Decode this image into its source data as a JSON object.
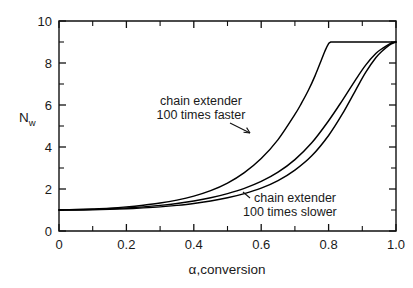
{
  "chart_data": {
    "type": "line",
    "title": "",
    "xlabel": "α,conversion",
    "ylabel": "Nw",
    "ylabel_base": "N",
    "ylabel_sub": "w",
    "xlim": [
      0,
      1.0
    ],
    "ylim": [
      0,
      10
    ],
    "grid": false,
    "legend": "none",
    "x_ticks": [
      "0",
      "0.2",
      "0.4",
      "0.6",
      "0.8",
      "1.0"
    ],
    "x_tick_values": [
      0,
      0.2,
      0.4,
      0.6,
      0.8,
      1.0
    ],
    "x_minor_tick_values": [
      0.1,
      0.3,
      0.5,
      0.7,
      0.9
    ],
    "y_ticks": [
      "0",
      "2",
      "4",
      "6",
      "8",
      "10"
    ],
    "y_tick_values": [
      0,
      2,
      4,
      6,
      8,
      10
    ],
    "y_minor_tick_values": [
      1,
      3,
      5,
      7,
      9
    ],
    "series": [
      {
        "name": "chain extender 100 times faster",
        "x": [
          0.0,
          0.05,
          0.1,
          0.15,
          0.2,
          0.25,
          0.3,
          0.35,
          0.4,
          0.45,
          0.5,
          0.55,
          0.6,
          0.65,
          0.7,
          0.72,
          0.74,
          0.76,
          0.78,
          0.79,
          0.8,
          0.805,
          0.81,
          0.85,
          0.9,
          0.95,
          1.0
        ],
        "y": [
          1.0,
          1.02,
          1.05,
          1.09,
          1.15,
          1.23,
          1.33,
          1.47,
          1.66,
          1.92,
          2.28,
          2.78,
          3.45,
          4.35,
          5.55,
          6.1,
          6.7,
          7.4,
          8.2,
          8.6,
          8.92,
          8.98,
          9.0,
          9.0,
          9.0,
          9.0,
          9.0
        ]
      },
      {
        "name": "chain extender middle",
        "x": [
          0.0,
          0.05,
          0.1,
          0.15,
          0.2,
          0.25,
          0.3,
          0.35,
          0.4,
          0.45,
          0.5,
          0.55,
          0.6,
          0.65,
          0.7,
          0.75,
          0.8,
          0.84,
          0.88,
          0.91,
          0.94,
          0.96,
          0.98,
          0.99,
          1.0
        ],
        "y": [
          1.0,
          1.01,
          1.03,
          1.06,
          1.1,
          1.15,
          1.22,
          1.31,
          1.43,
          1.58,
          1.78,
          2.03,
          2.36,
          2.8,
          3.4,
          4.2,
          5.25,
          6.2,
          7.2,
          7.9,
          8.45,
          8.7,
          8.9,
          8.96,
          9.0
        ]
      },
      {
        "name": "chain extender 100 times slower",
        "x": [
          0.0,
          0.05,
          0.1,
          0.15,
          0.2,
          0.25,
          0.3,
          0.35,
          0.4,
          0.45,
          0.5,
          0.55,
          0.6,
          0.65,
          0.7,
          0.75,
          0.8,
          0.84,
          0.88,
          0.91,
          0.94,
          0.96,
          0.98,
          0.99,
          1.0
        ],
        "y": [
          1.0,
          1.0,
          1.01,
          1.03,
          1.06,
          1.1,
          1.15,
          1.22,
          1.31,
          1.43,
          1.58,
          1.78,
          2.04,
          2.4,
          2.9,
          3.58,
          4.55,
          5.55,
          6.7,
          7.55,
          8.25,
          8.58,
          8.85,
          8.94,
          9.0
        ]
      }
    ],
    "annotations": [
      {
        "id": "faster",
        "line1": "chain extender",
        "line2": "100 times faster",
        "anchor_x": 0.59,
        "anchor_y": 6.0
      },
      {
        "id": "slower",
        "line1": "chain extender",
        "line2": "100 times slower",
        "anchor_x": 0.78,
        "anchor_y": 2.0
      }
    ],
    "plateau_value": 9,
    "plateau_start_x": 0.8,
    "start_value": 1
  }
}
